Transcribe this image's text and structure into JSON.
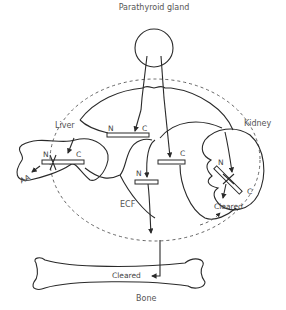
{
  "title": "Parathyroid gland",
  "organs": {
    "liver": "Liver",
    "kidney": "Kidney",
    "bone": "Bone",
    "ecf": "ECF"
  },
  "terminals": {
    "n": "N",
    "c": "C"
  },
  "labels": {
    "aa": "AA",
    "cleared_kidney": "Cleared",
    "cleared_bone": "Cleared"
  },
  "colors": {
    "line": "#2a2a2a",
    "text": "#555555",
    "background": "#ffffff"
  }
}
